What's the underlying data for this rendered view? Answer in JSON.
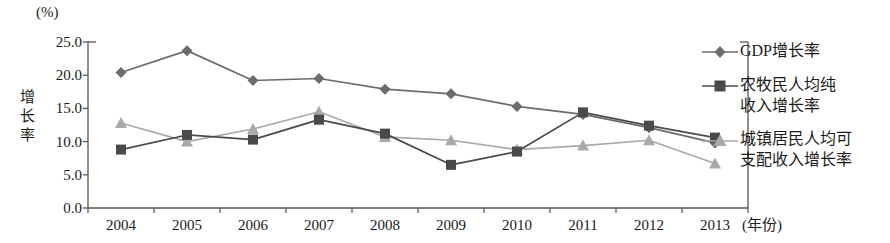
{
  "chart_data": {
    "type": "line",
    "title": "",
    "unit_label": "(%)",
    "ylabel": "增长率",
    "xlabel": "(年份)",
    "categories": [
      "2004",
      "2005",
      "2006",
      "2007",
      "2008",
      "2009",
      "2010",
      "2011",
      "2012",
      "2013"
    ],
    "ylim": [
      0.0,
      25.0
    ],
    "yticks": [
      "0.0",
      "5.0",
      "10.0",
      "15.0",
      "20.0",
      "25.0"
    ],
    "ytick_values": [
      0.0,
      5.0,
      10.0,
      15.0,
      20.0,
      25.0
    ],
    "grid": false,
    "legend_position": "right",
    "series": [
      {
        "name": "GDP增长率",
        "marker": "diamond",
        "color": "#706b6b",
        "values": [
          20.4,
          23.7,
          19.2,
          19.5,
          17.9,
          17.2,
          15.3,
          14.1,
          12.1,
          9.8
        ]
      },
      {
        "name": "农牧民人均纯收入增长率",
        "name_line1": "农牧民人均纯",
        "name_line2": "收入增长率",
        "marker": "square",
        "color": "#4a4a4a",
        "values": [
          8.8,
          11.0,
          10.3,
          13.3,
          11.2,
          6.5,
          8.5,
          14.4,
          12.4,
          10.6
        ]
      },
      {
        "name": "城镇居民人均可支配收入增长率",
        "name_line1": "城镇居民人均可",
        "name_line2": "支配收入增长率",
        "marker": "triangle",
        "color": "#a9a9a9",
        "values": [
          12.8,
          10.0,
          11.9,
          14.5,
          10.7,
          10.2,
          8.8,
          9.4,
          10.2,
          6.7
        ]
      }
    ]
  },
  "axis": {
    "color": "#555555"
  }
}
